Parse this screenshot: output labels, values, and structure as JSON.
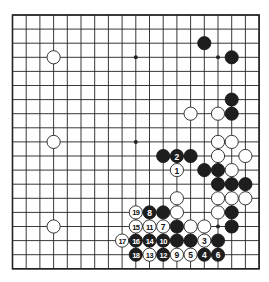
{
  "diagram": {
    "type": "go-board",
    "size": 19,
    "geometry": {
      "x0": 12.5,
      "y0": 15,
      "dx": 13.7,
      "dy": 14.1,
      "stone_radius": 6.6
    },
    "colors": {
      "black": "#1e1e1e",
      "white": "#ffffff",
      "line": "#222222",
      "background": "#ffffff"
    },
    "hoshi": [
      [
        3,
        3
      ],
      [
        9,
        3
      ],
      [
        15,
        3
      ],
      [
        3,
        9
      ],
      [
        9,
        9
      ],
      [
        15,
        9
      ],
      [
        3,
        15
      ],
      [
        9,
        15
      ],
      [
        15,
        15
      ]
    ],
    "stones": [
      {
        "color": "black",
        "col": 14,
        "row": 2
      },
      {
        "color": "black",
        "col": 16,
        "row": 3
      },
      {
        "color": "white",
        "col": 3,
        "row": 3
      },
      {
        "color": "black",
        "col": 16,
        "row": 6
      },
      {
        "color": "black",
        "col": 16,
        "row": 7
      },
      {
        "color": "white",
        "col": 13,
        "row": 7
      },
      {
        "color": "white",
        "col": 15,
        "row": 7
      },
      {
        "color": "white",
        "col": 3,
        "row": 9
      },
      {
        "color": "white",
        "col": 15,
        "row": 9
      },
      {
        "color": "white",
        "col": 16,
        "row": 9
      },
      {
        "color": "black",
        "col": 11,
        "row": 10
      },
      {
        "color": "black",
        "col": 12,
        "row": 10,
        "label": "2"
      },
      {
        "color": "black",
        "col": 13,
        "row": 10
      },
      {
        "color": "white",
        "col": 15,
        "row": 10
      },
      {
        "color": "white",
        "col": 17,
        "row": 10
      },
      {
        "color": "white",
        "col": 12,
        "row": 11,
        "label": "1"
      },
      {
        "color": "black",
        "col": 14,
        "row": 11
      },
      {
        "color": "black",
        "col": 15,
        "row": 11
      },
      {
        "color": "white",
        "col": 16,
        "row": 11
      },
      {
        "color": "black",
        "col": 15,
        "row": 12
      },
      {
        "color": "black",
        "col": 16,
        "row": 12
      },
      {
        "color": "black",
        "col": 17,
        "row": 12
      },
      {
        "color": "white",
        "col": 12,
        "row": 13
      },
      {
        "color": "white",
        "col": 15,
        "row": 13
      },
      {
        "color": "white",
        "col": 16,
        "row": 13
      },
      {
        "color": "white",
        "col": 17,
        "row": 13
      },
      {
        "color": "white",
        "col": 9,
        "row": 14,
        "label": "19"
      },
      {
        "color": "black",
        "col": 10,
        "row": 14,
        "label": "8"
      },
      {
        "color": "black",
        "col": 11,
        "row": 14
      },
      {
        "color": "white",
        "col": 12,
        "row": 14
      },
      {
        "color": "white",
        "col": 15,
        "row": 14
      },
      {
        "color": "black",
        "col": 16,
        "row": 14
      },
      {
        "color": "white",
        "col": 3,
        "row": 15
      },
      {
        "color": "white",
        "col": 9,
        "row": 15,
        "label": "15"
      },
      {
        "color": "white",
        "col": 10,
        "row": 15,
        "label": "11"
      },
      {
        "color": "white",
        "col": 11,
        "row": 15,
        "label": "7"
      },
      {
        "color": "black",
        "col": 12,
        "row": 15
      },
      {
        "color": "white",
        "col": 13,
        "row": 15
      },
      {
        "color": "white",
        "col": 14,
        "row": 15
      },
      {
        "color": "black",
        "col": 16,
        "row": 15
      },
      {
        "color": "white",
        "col": 8,
        "row": 16,
        "label": "17"
      },
      {
        "color": "black",
        "col": 9,
        "row": 16,
        "label": "16"
      },
      {
        "color": "black",
        "col": 10,
        "row": 16,
        "label": "14"
      },
      {
        "color": "black",
        "col": 11,
        "row": 16,
        "label": "10"
      },
      {
        "color": "black",
        "col": 12,
        "row": 16
      },
      {
        "color": "black",
        "col": 13,
        "row": 16
      },
      {
        "color": "white",
        "col": 14,
        "row": 16,
        "label": "3"
      },
      {
        "color": "black",
        "col": 15,
        "row": 16
      },
      {
        "color": "black",
        "col": 9,
        "row": 17,
        "label": "18"
      },
      {
        "color": "white",
        "col": 10,
        "row": 17,
        "label": "13"
      },
      {
        "color": "black",
        "col": 11,
        "row": 17,
        "label": "12"
      },
      {
        "color": "white",
        "col": 12,
        "row": 17,
        "label": "9"
      },
      {
        "color": "white",
        "col": 13,
        "row": 17,
        "label": "5"
      },
      {
        "color": "black",
        "col": 14,
        "row": 17,
        "label": "4"
      },
      {
        "color": "black",
        "col": 15,
        "row": 17,
        "label": "6"
      }
    ]
  }
}
